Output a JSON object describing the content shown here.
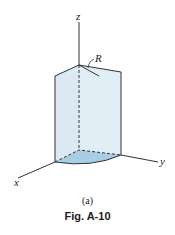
{
  "figure": {
    "axes": {
      "x": "x",
      "y": "y",
      "z": "z"
    },
    "radius_label": "R",
    "subcaption": "(a)",
    "caption": "Fig. A-10",
    "colors": {
      "face": "#dbe9f3",
      "base": "#a9cde4",
      "stroke": "#333333"
    }
  }
}
